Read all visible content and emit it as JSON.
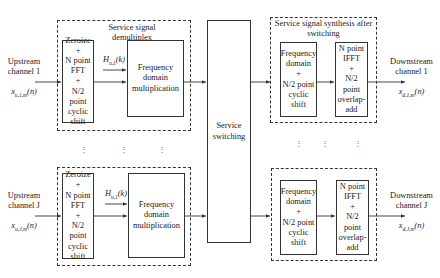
{
  "diagram": {
    "demux_group_title": "Service signal\ndemultiplex",
    "synth_group_title": "Service signal synthesis after\nswitching",
    "switch_block": "Service\nswitching",
    "rows": [
      {
        "input_label": "Upstream\nchannel 1",
        "input_signal": "x",
        "input_signal_sub": "u,1,m",
        "input_signal_arg": "(n)",
        "fft_block": "Zeroize\n+\nN point\nFFT\n+\nN/2\npoint\ncyclic\nshift",
        "filter_label": "H",
        "filter_sub": "u,1",
        "filter_arg": "(k)",
        "mult_block": "Frequency\ndomain\nmultiplication",
        "shift_block": "Frequency\ndomain\n+\nN/2 point\ncyclic shift",
        "ifft_block": "N point\nIFFT\n+\nN/2\npoint\noverlap-\nadd",
        "output_label": "Downstream\nchannel 1",
        "output_signal": "x",
        "output_signal_sub": "d,1,m",
        "output_signal_arg": "(n)"
      },
      {
        "input_label": "Upstream\nchannel J",
        "input_signal": "x",
        "input_signal_sub": "u,J,m",
        "input_signal_arg": "(n)",
        "fft_block": "Zeroize\n+\nN point\nFFT\n+\nN/2\npoint\ncyclic\nshift",
        "filter_label": "H",
        "filter_sub": "u,1",
        "filter_arg": "(k)",
        "mult_block": "Frequency\ndomain\nmultiplication",
        "shift_block": "Frequency\ndomain\n+\nN/2 point\ncyclic shift",
        "ifft_block": "N point\nIFFT\n+\nN/2\npoint\noverlap-\nadd",
        "output_label": "Downstream\nchannel J",
        "output_signal": "x",
        "output_signal_sub": "d,J,m",
        "output_signal_arg": "(n)"
      }
    ],
    "ellipsis": "⋮",
    "colors": {
      "stroke": "#333333",
      "background": "#ffffff",
      "text": "#222222"
    }
  }
}
